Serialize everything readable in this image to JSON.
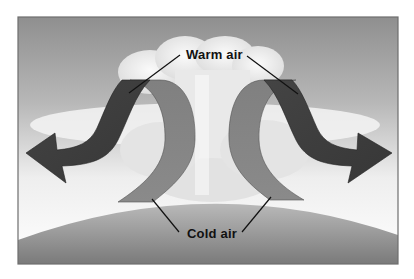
{
  "diagram": {
    "title": "",
    "labels": {
      "warm_air": "Warm air",
      "cold_air": "Cold air"
    },
    "elements": [
      {
        "name": "warm-air-arrow-left",
        "direction": "down-left",
        "color": "#3c3c3c"
      },
      {
        "name": "warm-air-arrow-right",
        "direction": "down-right",
        "color": "#3c3c3c"
      },
      {
        "name": "cold-air-arrow-left",
        "direction": "down",
        "color": "#7d7d7d"
      },
      {
        "name": "cold-air-arrow-right",
        "direction": "down",
        "color": "#7d7d7d"
      },
      {
        "name": "cloud",
        "color": "#efefef"
      },
      {
        "name": "ground",
        "color": "#8e8e8e"
      }
    ],
    "colors": {
      "sky_top": "#8f8f8f",
      "sky_mid": "#d9d9d9",
      "warm_arrow": "#3c3c3c",
      "cold_arrow": "#7d7d7d",
      "ground_top": "#b5b5b5",
      "ground_bottom": "#7a7a7a",
      "frame": "#6e6e6e",
      "label_text": "#111111"
    }
  }
}
